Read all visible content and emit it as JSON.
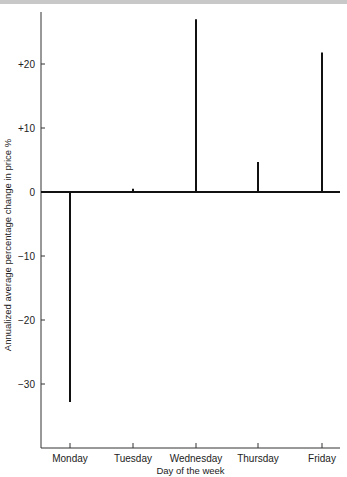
{
  "chart_data": {
    "type": "bar",
    "title": "",
    "xlabel": "Day of the week",
    "ylabel": "Annualized average percentage change in price %",
    "categories": [
      "Monday",
      "Tuesday",
      "Wednesday",
      "Thursday",
      "Friday"
    ],
    "values": [
      -32.8,
      0.5,
      27.0,
      4.7,
      21.8
    ],
    "ylim": [
      -40,
      28
    ],
    "yticks": [
      20,
      10,
      0,
      -10,
      -20,
      -30
    ],
    "ytick_labels": [
      "+20",
      "+10",
      "0",
      "−10",
      "−20",
      "−30"
    ],
    "grid": false,
    "legend": null
  }
}
